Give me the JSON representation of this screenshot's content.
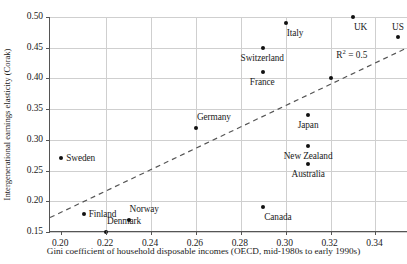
{
  "chart_data": {
    "type": "scatter",
    "title": "",
    "xlabel": "Gini coefficient of household disposable incomes (OECD, mid-1980s to early 1990s)",
    "ylabel": "Intergenerational earnings elasticity (Corak)",
    "xlim": [
      0.195,
      0.3545
    ],
    "ylim": [
      0.15,
      0.5
    ],
    "xticks": [
      0.2,
      0.22,
      0.24,
      0.26,
      0.28,
      0.3,
      0.32,
      0.34
    ],
    "xticklabels": [
      "0.20",
      "0.22",
      "0.24",
      "0.26",
      "0.28",
      "0.30",
      "0.32",
      "0.34"
    ],
    "yticks": [
      0.15,
      0.2,
      0.25,
      0.3,
      0.35,
      0.4,
      0.45,
      0.5
    ],
    "yticklabels": [
      "0.15",
      "0.20",
      "0.25",
      "0.30",
      "0.35",
      "0.40",
      "0.45",
      "0.50"
    ],
    "grid": true,
    "legend": null,
    "annotations": [
      {
        "text": "R² = 0.5",
        "x": 0.3295,
        "y": 0.4405
      }
    ],
    "trendline": {
      "type": "linear-dashed",
      "x0": 0.195,
      "y0": 0.1735,
      "x1": 0.3545,
      "y1": 0.4505
    },
    "points": [
      {
        "label": "Sweden",
        "x": 0.2,
        "y": 0.27,
        "label_dx": 5,
        "label_dy": -5
      },
      {
        "label": "Finland",
        "x": 0.21,
        "y": 0.18,
        "label_dx": 5,
        "label_dy": -5
      },
      {
        "label": "Denmark",
        "x": 0.22,
        "y": 0.15,
        "label_dx": 1,
        "label_dy": -16
      },
      {
        "label": "Norway",
        "x": 0.23,
        "y": 0.17,
        "label_dx": 1,
        "label_dy": -16
      },
      {
        "label": "Germany",
        "x": 0.26,
        "y": 0.32,
        "label_dx": 1,
        "label_dy": -16
      },
      {
        "label": "Canada",
        "x": 0.29,
        "y": 0.19,
        "label_dx": 1,
        "label_dy": 5
      },
      {
        "label": "France",
        "x": 0.29,
        "y": 0.41,
        "label_dx": -1,
        "label_dy": 5
      },
      {
        "label": "Switzerland",
        "x": 0.29,
        "y": 0.45,
        "label_dx": -1,
        "label_dy": 5
      },
      {
        "label": "Italy",
        "x": 0.3,
        "y": 0.49,
        "label_dx": 1,
        "label_dy": 5
      },
      {
        "label": "Australia",
        "x": 0.31,
        "y": 0.26,
        "label_dx": 0,
        "label_dy": 5
      },
      {
        "label": "New Zealand",
        "x": 0.31,
        "y": 0.29,
        "label_dx": 0,
        "label_dy": 5
      },
      {
        "label": "Japan",
        "x": 0.31,
        "y": 0.34,
        "label_dx": 0,
        "label_dy": 5
      },
      {
        "label": "",
        "x": 0.32,
        "y": 0.4,
        "label_dx": 0,
        "label_dy": 0
      },
      {
        "label": "UK",
        "x": 0.33,
        "y": 0.5,
        "label_dx": 1,
        "label_dy": 5
      },
      {
        "label": "US",
        "x": 0.35,
        "y": 0.468,
        "label_dx": 0,
        "label_dy": -15
      }
    ]
  },
  "style": {
    "point_color": "#111111",
    "grid_color": "#cfcfcf",
    "axis_color": "#555555",
    "text_color": "#1a1a1a",
    "trend_color": "#555555",
    "background": "#ffffff"
  }
}
